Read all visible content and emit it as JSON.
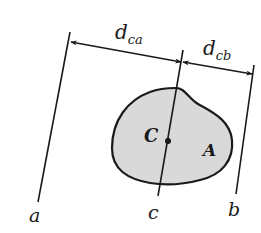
{
  "diagram": {
    "dimensions": {
      "d_ca": {
        "main": "d",
        "sub": "ca"
      },
      "d_cb": {
        "main": "d",
        "sub": "cb"
      }
    },
    "axes": {
      "a": "a",
      "b": "b",
      "c": "c"
    },
    "region": {
      "centroid_label": "C",
      "area_label": "A",
      "fill_color": "#d9d9d9",
      "stroke_color": "#1a1a1a"
    }
  }
}
